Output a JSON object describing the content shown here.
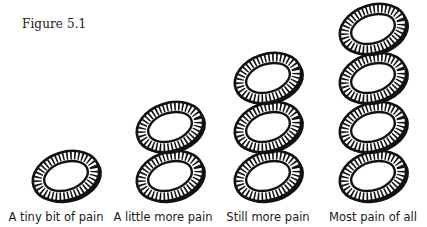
{
  "figure": {
    "title": "Figure 5.1"
  },
  "columns": [
    {
      "label": "A tiny bit of pain",
      "washer_count": 1
    },
    {
      "label": "A little more pain",
      "washer_count": 2
    },
    {
      "label": "Still more pain",
      "washer_count": 3
    },
    {
      "label": "Most pain of all",
      "washer_count": 4
    }
  ],
  "colors": {
    "ink": "#111111",
    "background": "#ffffff"
  }
}
